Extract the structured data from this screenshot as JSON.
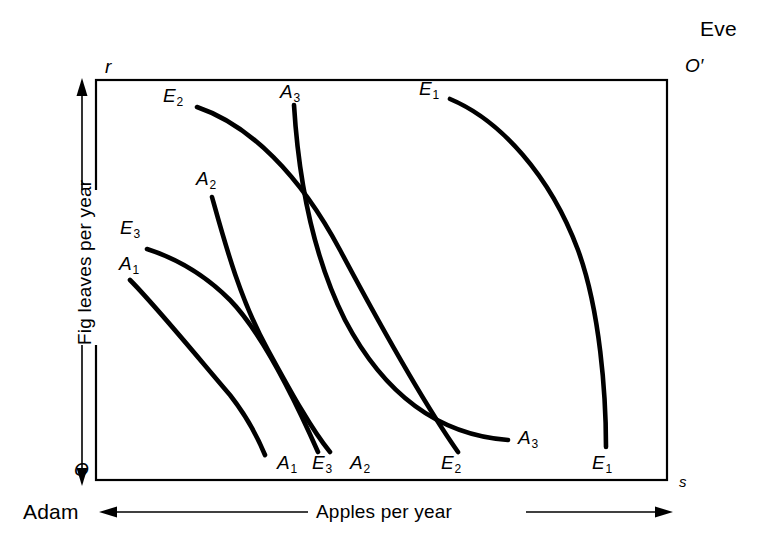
{
  "figure": {
    "type": "edgeworth-box",
    "background_color": "#ffffff",
    "line_color": "#000000",
    "corners": {
      "origin_adam": "O",
      "origin_eve": "O′",
      "horizontal_axis_symbol": "s",
      "vertical_axis_symbol": "r"
    },
    "agents": {
      "lower_left": "Adam",
      "upper_right": "Eve"
    },
    "axis_titles": {
      "horizontal": "Apples per year",
      "vertical": "Fig leaves per year"
    }
  },
  "chart_data": {
    "type": "line",
    "title": "",
    "subtitle": "",
    "xlabel": "Apples per year",
    "ylabel": "Fig leaves per year",
    "xlim": [
      0,
      1
    ],
    "ylim": [
      0,
      1
    ],
    "grid": false,
    "legend": "none",
    "annotations": [
      {
        "text": "Eve",
        "x": 0.985,
        "y": 1.105,
        "role": "agent-label"
      },
      {
        "text": "O′",
        "x": 0.985,
        "y": 1.035,
        "role": "origin-eve"
      },
      {
        "text": "r",
        "x": -0.022,
        "y": 1.028,
        "role": "axis-symbol-vertical"
      },
      {
        "text": "O",
        "x": -0.038,
        "y": -0.018,
        "role": "origin-adam"
      },
      {
        "text": "s",
        "x": 1.032,
        "y": -0.028,
        "role": "axis-symbol-horizontal"
      },
      {
        "text": "Adam",
        "x": -0.13,
        "y": -0.11,
        "role": "agent-label"
      }
    ],
    "series": [
      {
        "name": "A1",
        "label": "A₁",
        "owner": "Adam",
        "index": 1,
        "label_start": {
          "text": "A₁",
          "x": 128,
          "y": 263
        },
        "label_end": {
          "text": "A₁",
          "x": 277,
          "y": 462
        },
        "path": "M 130 280 C 155 305, 200 360, 230 395 C 248 418, 258 438, 265 455"
      },
      {
        "name": "A2",
        "label": "A₂",
        "owner": "Adam",
        "index": 2,
        "label_start": {
          "text": "A₂",
          "x": 196,
          "y": 178
        },
        "label_end": {
          "text": "A₂",
          "x": 350,
          "y": 462
        },
        "path": "M 212 197 C 224 240, 240 300, 268 350 C 292 394, 312 430, 330 452"
      },
      {
        "name": "A3",
        "label": "A₃",
        "owner": "Adam",
        "index": 3,
        "label_start": {
          "text": "A₃",
          "x": 280,
          "y": 92
        },
        "label_end": {
          "text": "A₃",
          "x": 518,
          "y": 431
        },
        "path": "M 294 105 C 298 170, 310 250, 345 320 C 385 396, 440 435, 508 440"
      },
      {
        "name": "E1",
        "label": "E₁",
        "owner": "Eve",
        "index": 1,
        "label_start": {
          "text": "E₁",
          "x": 419,
          "y": 88
        },
        "label_end": {
          "text": "E₁",
          "x": 592,
          "y": 462
        },
        "path": "M 450 99 C 500 120, 550 175, 578 250 C 600 310, 606 395, 606 447"
      },
      {
        "name": "E2",
        "label": "E₂",
        "owner": "Eve",
        "index": 2,
        "label_start": {
          "text": "E₂",
          "x": 163,
          "y": 96
        },
        "label_end": {
          "text": "E₂",
          "x": 441,
          "y": 462
        },
        "path": "M 197 107 C 250 125, 300 175, 340 250 C 380 325, 425 405, 458 452"
      },
      {
        "name": "E3",
        "label": "E₃",
        "owner": "Eve",
        "index": 3,
        "label_start": {
          "text": "E₃",
          "x": 120,
          "y": 227
        },
        "label_end": {
          "text": "E₃",
          "x": 312,
          "y": 462
        },
        "path": "M 147 249 C 175 258, 205 275, 230 300 C 262 333, 295 400, 318 452"
      }
    ],
    "intersections": [
      {
        "curves": [
          "A3",
          "E2"
        ],
        "x": 299,
        "y": 154
      },
      {
        "curves": [
          "A2",
          "E3"
        ],
        "x": 236,
        "y": 289
      },
      {
        "curves": [
          "A2",
          "E3"
        ],
        "x": 318,
        "y": 409
      },
      {
        "curves": [
          "A3",
          "E1"
        ],
        "x": 435,
        "y": 405
      },
      {
        "curves": [
          "E2",
          "A3"
        ],
        "x": 455,
        "y": 410
      }
    ]
  }
}
